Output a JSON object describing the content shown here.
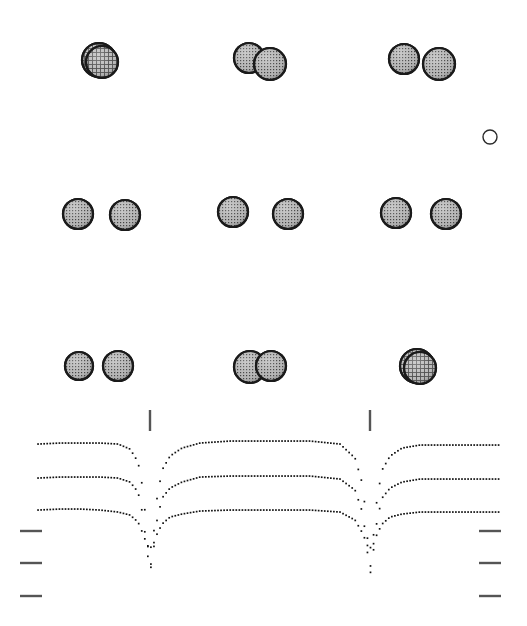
{
  "figure": {
    "title": "",
    "background_color": "#ffffff",
    "width": 527,
    "height": 626,
    "sphere_fill": "#9a9a9a",
    "sphere_stroke": "#1a1a1a",
    "hatch_color": "#3a3a3a",
    "curve_color": "#111111",
    "tick_color": "#555555"
  },
  "panels": {
    "rows": [
      {
        "name": "row-top",
        "label": "",
        "center_y": 61,
        "groups": [
          {
            "name": "group-left",
            "label": "",
            "kind": "merged",
            "spheres": [
              {
                "cx": 99,
                "cy": 60,
                "r": 17,
                "style": "merged-large"
              },
              {
                "cx": 102,
                "cy": 62,
                "r": 16,
                "style": "merged-large"
              }
            ]
          },
          {
            "name": "group-middle",
            "label": "",
            "kind": "touching",
            "spheres": [
              {
                "cx": 249,
                "cy": 58,
                "r": 15,
                "style": "hatched"
              },
              {
                "cx": 270,
                "cy": 64,
                "r": 16,
                "style": "hatched"
              }
            ]
          },
          {
            "name": "group-right",
            "label": "",
            "kind": "separated",
            "spheres": [
              {
                "cx": 404,
                "cy": 59,
                "r": 15,
                "style": "hatched"
              },
              {
                "cx": 439,
                "cy": 64,
                "r": 16,
                "style": "hatched"
              }
            ]
          }
        ]
      },
      {
        "name": "row-middle",
        "label": "",
        "center_y": 214,
        "groups": [
          {
            "name": "group-left",
            "label": "",
            "kind": "separated",
            "spheres": [
              {
                "cx": 78,
                "cy": 214,
                "r": 15,
                "style": "hatched"
              },
              {
                "cx": 125,
                "cy": 215,
                "r": 15,
                "style": "hatched"
              }
            ]
          },
          {
            "name": "group-middle",
            "label": "",
            "kind": "separated",
            "spheres": [
              {
                "cx": 233,
                "cy": 212,
                "r": 15,
                "style": "hatched"
              },
              {
                "cx": 288,
                "cy": 214,
                "r": 15,
                "style": "hatched"
              }
            ]
          },
          {
            "name": "group-right",
            "label": "",
            "kind": "separated",
            "spheres": [
              {
                "cx": 396,
                "cy": 213,
                "r": 15,
                "style": "hatched"
              },
              {
                "cx": 446,
                "cy": 214,
                "r": 15,
                "style": "hatched"
              }
            ]
          }
        ]
      },
      {
        "name": "row-bottom",
        "label": "",
        "center_y": 366,
        "groups": [
          {
            "name": "group-left",
            "label": "",
            "kind": "separated",
            "spheres": [
              {
                "cx": 79,
                "cy": 366,
                "r": 14,
                "style": "hatched"
              },
              {
                "cx": 118,
                "cy": 366,
                "r": 15,
                "style": "hatched"
              }
            ]
          },
          {
            "name": "group-middle",
            "label": "",
            "kind": "touching",
            "spheres": [
              {
                "cx": 250,
                "cy": 367,
                "r": 16,
                "style": "hatched"
              },
              {
                "cx": 271,
                "cy": 366,
                "r": 15,
                "style": "hatched"
              }
            ]
          },
          {
            "name": "group-right",
            "label": "",
            "kind": "merged",
            "spheres": [
              {
                "cx": 417,
                "cy": 366,
                "r": 17,
                "style": "merged-large"
              },
              {
                "cx": 420,
                "cy": 368,
                "r": 16,
                "style": "merged-large"
              }
            ]
          }
        ]
      }
    ],
    "stray_marker": {
      "name": "open-circle-marker",
      "label": "",
      "cx": 490,
      "cy": 137,
      "r": 7,
      "style": "open"
    }
  },
  "chart_data": {
    "type": "line",
    "title": "",
    "subtitle": "",
    "xlabel": "",
    "ylabel": "",
    "xlim": [
      0,
      527
    ],
    "ylim": [
      626,
      400
    ],
    "grid": false,
    "legend": null,
    "line_style": "dotted",
    "marker_size": 1.6,
    "series": [
      {
        "name": "potential-curve-1",
        "label": "",
        "color": "#111111",
        "plateau_levels": [
          444,
          441,
          445
        ],
        "well_centers": [
          150,
          370
        ],
        "well_depths": [
          589,
          589
        ],
        "points_x": [
          38,
          60,
          80,
          100,
          118,
          130,
          138,
          143,
          147,
          150,
          153,
          157,
          162,
          170,
          182,
          200,
          230,
          270,
          310,
          340,
          355,
          363,
          367,
          370,
          373,
          377,
          382,
          390,
          402,
          420,
          450,
          480,
          500
        ],
        "points_y": [
          444,
          443,
          443,
          443,
          444,
          449,
          462,
          490,
          535,
          578,
          540,
          498,
          470,
          456,
          448,
          443,
          441,
          441,
          441,
          444,
          458,
          486,
          532,
          578,
          540,
          498,
          470,
          456,
          448,
          445,
          445,
          445,
          445
        ]
      },
      {
        "name": "potential-curve-2",
        "label": "",
        "color": "#111111",
        "plateau_levels": [
          478,
          477,
          479
        ],
        "well_centers": [
          150,
          370
        ],
        "well_depths": [
          570,
          570
        ],
        "points_x": [
          38,
          60,
          80,
          100,
          118,
          130,
          138,
          143,
          147,
          150,
          153,
          157,
          162,
          170,
          182,
          200,
          230,
          270,
          310,
          340,
          355,
          363,
          367,
          370,
          373,
          377,
          382,
          390,
          402,
          420,
          450,
          480,
          500
        ],
        "points_y": [
          478,
          477,
          477,
          477,
          478,
          482,
          492,
          516,
          552,
          568,
          554,
          520,
          498,
          488,
          482,
          477,
          476,
          476,
          476,
          479,
          490,
          514,
          550,
          568,
          554,
          520,
          498,
          488,
          482,
          479,
          479,
          479,
          479
        ]
      },
      {
        "name": "potential-curve-3",
        "label": "",
        "color": "#111111",
        "plateau_levels": [
          510,
          509,
          512
        ],
        "well_centers": [
          150,
          370
        ],
        "well_depths": [
          548,
          548
        ],
        "points_x": [
          38,
          60,
          80,
          100,
          118,
          130,
          138,
          143,
          147,
          150,
          153,
          157,
          162,
          170,
          182,
          200,
          230,
          270,
          310,
          340,
          355,
          363,
          367,
          370,
          373,
          377,
          382,
          390,
          402,
          420,
          450,
          480,
          500
        ],
        "points_y": [
          510,
          509,
          509,
          510,
          512,
          515,
          522,
          534,
          545,
          548,
          545,
          534,
          524,
          517,
          514,
          511,
          510,
          510,
          510,
          512,
          520,
          534,
          545,
          548,
          545,
          534,
          524,
          517,
          514,
          512,
          512,
          512,
          512
        ]
      }
    ],
    "left_ticks": [
      {
        "name": "level-tick-left-1",
        "label": "",
        "y": 531,
        "x1": 20,
        "x2": 42
      },
      {
        "name": "level-tick-left-2",
        "label": "",
        "y": 563,
        "x1": 20,
        "x2": 42
      },
      {
        "name": "level-tick-left-3",
        "label": "",
        "y": 596,
        "x1": 20,
        "x2": 42
      }
    ],
    "right_ticks": [
      {
        "name": "level-tick-right-1",
        "label": "",
        "y": 531,
        "x1": 479,
        "x2": 501
      },
      {
        "name": "level-tick-right-2",
        "label": "",
        "y": 563,
        "x1": 479,
        "x2": 501
      },
      {
        "name": "level-tick-right-3",
        "label": "",
        "y": 596,
        "x1": 479,
        "x2": 501
      }
    ],
    "vertical_markers": [
      {
        "name": "well-marker-1",
        "label": "",
        "x": 150,
        "y1": 410,
        "y2": 431
      },
      {
        "name": "well-marker-2",
        "label": "",
        "x": 370,
        "y1": 410,
        "y2": 431
      }
    ]
  }
}
